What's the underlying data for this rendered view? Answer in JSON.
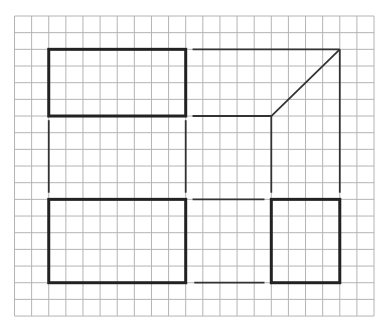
{
  "diagram": {
    "type": "orthographic-projection-on-grid",
    "background": "#ffffff",
    "grid": {
      "origin_x": 14.5,
      "origin_y": 16,
      "cell_w": 17.12,
      "cell_h": 16.67,
      "cols": 21,
      "rows": 18,
      "color": "#b4b4b4",
      "stroke_width": 1
    },
    "shapes": [
      {
        "name": "front-view-rectangle",
        "kind": "rect",
        "col": 2,
        "row": 2,
        "w": 8,
        "h": 4,
        "color": "#222222",
        "stroke_width": 3
      },
      {
        "name": "top-view-rectangle",
        "kind": "rect",
        "col": 2,
        "row": 11,
        "w": 8,
        "h": 5,
        "color": "#222222",
        "stroke_width": 3
      },
      {
        "name": "side-view-rectangle",
        "kind": "rect",
        "col": 15,
        "row": 11,
        "w": 4,
        "h": 5,
        "color": "#222222",
        "stroke_width": 3
      }
    ],
    "construction_lines": [
      {
        "name": "projector-top-horizontal",
        "x1": 10.4,
        "y1": 2,
        "x2": 19,
        "y2": 2
      },
      {
        "name": "projector-mid-horizontal",
        "x1": 10.4,
        "y1": 6,
        "x2": 15,
        "y2": 6
      },
      {
        "name": "miter-diagonal",
        "x1": 19,
        "y1": 2,
        "x2": 15,
        "y2": 6
      },
      {
        "name": "projector-right-vertical-outer",
        "x1": 19,
        "y1": 2,
        "x2": 19,
        "y2": 10.6
      },
      {
        "name": "projector-right-vertical-inner",
        "x1": 15,
        "y1": 6,
        "x2": 15,
        "y2": 10.6
      },
      {
        "name": "projector-left-vertical-1",
        "x1": 2,
        "y1": 6.25,
        "x2": 2,
        "y2": 10.6
      },
      {
        "name": "projector-left-vertical-2",
        "x1": 10,
        "y1": 6.25,
        "x2": 10,
        "y2": 10.6
      },
      {
        "name": "projector-bottom-horizontal-1",
        "x1": 10.4,
        "y1": 11,
        "x2": 14.6,
        "y2": 11
      },
      {
        "name": "projector-bottom-horizontal-2",
        "x1": 10.5,
        "y1": 16,
        "x2": 14.6,
        "y2": 16
      }
    ],
    "construction_color": "#333333",
    "construction_stroke_width": 1.8
  }
}
